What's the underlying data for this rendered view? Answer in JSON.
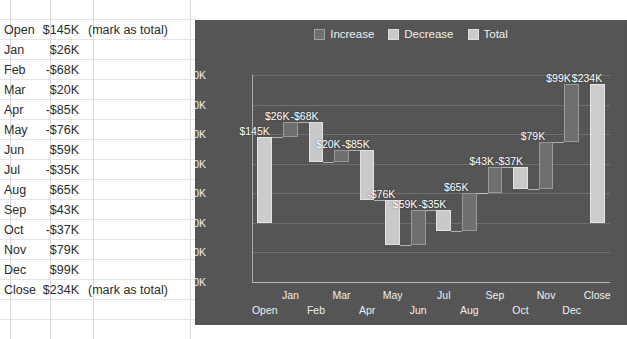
{
  "spreadsheet": {
    "columns": [
      "category",
      "amount",
      "note"
    ],
    "rows": [
      {
        "category": "Open",
        "amount": "$145K",
        "note": "(mark as total)"
      },
      {
        "category": "Jan",
        "amount": "$26K",
        "note": ""
      },
      {
        "category": "Feb",
        "amount": "-$68K",
        "note": ""
      },
      {
        "category": "Mar",
        "amount": "$20K",
        "note": ""
      },
      {
        "category": "Apr",
        "amount": "-$85K",
        "note": ""
      },
      {
        "category": "May",
        "amount": "-$76K",
        "note": ""
      },
      {
        "category": "Jun",
        "amount": "$59K",
        "note": ""
      },
      {
        "category": "Jul",
        "amount": "-$35K",
        "note": ""
      },
      {
        "category": "Aug",
        "amount": "$65K",
        "note": ""
      },
      {
        "category": "Sep",
        "amount": "$43K",
        "note": ""
      },
      {
        "category": "Oct",
        "amount": "-$37K",
        "note": ""
      },
      {
        "category": "Nov",
        "amount": "$79K",
        "note": ""
      },
      {
        "category": "Dec",
        "amount": "$99K",
        "note": ""
      },
      {
        "category": "Close",
        "amount": "$234K",
        "note": "(mark as total)"
      }
    ]
  },
  "chart_data": {
    "type": "bar",
    "subtype": "waterfall",
    "title": "",
    "xlabel": "",
    "ylabel": "",
    "ylim": [
      -100,
      250
    ],
    "yticks": [
      250,
      200,
      150,
      100,
      50,
      0,
      -50,
      -100
    ],
    "ytick_labels": [
      "$250K",
      "$200K",
      "$150K",
      "$100K",
      "$50K",
      "$0K",
      "-$50K",
      "-$100K"
    ],
    "grid": true,
    "legend": {
      "position": "top-center",
      "entries": [
        {
          "label": "Increase",
          "color": "#6f6f6f"
        },
        {
          "label": "Decrease",
          "color": "#c9c9c9"
        },
        {
          "label": "Total",
          "color": "#cccccc"
        }
      ]
    },
    "categories": [
      "Open",
      "Jan",
      "Feb",
      "Mar",
      "Apr",
      "May",
      "Jun",
      "Jul",
      "Aug",
      "Sep",
      "Oct",
      "Nov",
      "Dec",
      "Close"
    ],
    "values": [
      145,
      26,
      -68,
      20,
      -85,
      -76,
      59,
      -35,
      65,
      43,
      -37,
      79,
      99,
      234
    ],
    "data_labels": [
      "$145K",
      "$26K",
      "-$68K",
      "$20K",
      "-$85K",
      "-$76K",
      "$59K",
      "-$35K",
      "$65K",
      "$43K",
      "-$37K",
      "$79K",
      "$99K",
      "$234K"
    ],
    "kinds": [
      "total",
      "increase",
      "decrease",
      "increase",
      "decrease",
      "decrease",
      "increase",
      "decrease",
      "increase",
      "increase",
      "decrease",
      "increase",
      "increase",
      "total"
    ],
    "cumulative_start": [
      0,
      145,
      171,
      103,
      123,
      38,
      -38,
      21,
      -14,
      51,
      94,
      57,
      136,
      0
    ],
    "cumulative_end": [
      145,
      171,
      103,
      123,
      38,
      -38,
      21,
      -14,
      51,
      94,
      57,
      136,
      235,
      234
    ],
    "xtick_rows": [
      1,
      0,
      1,
      0,
      1,
      0,
      1,
      0,
      1,
      0,
      1,
      0,
      1,
      0
    ]
  },
  "colors": {
    "chart_background": "#545454",
    "increase": "#6f6f6f",
    "decrease": "#c9c9c9",
    "total": "#cccccc",
    "axis": "#f0f0f0",
    "grid": "rgba(255,255,255,.16)"
  }
}
